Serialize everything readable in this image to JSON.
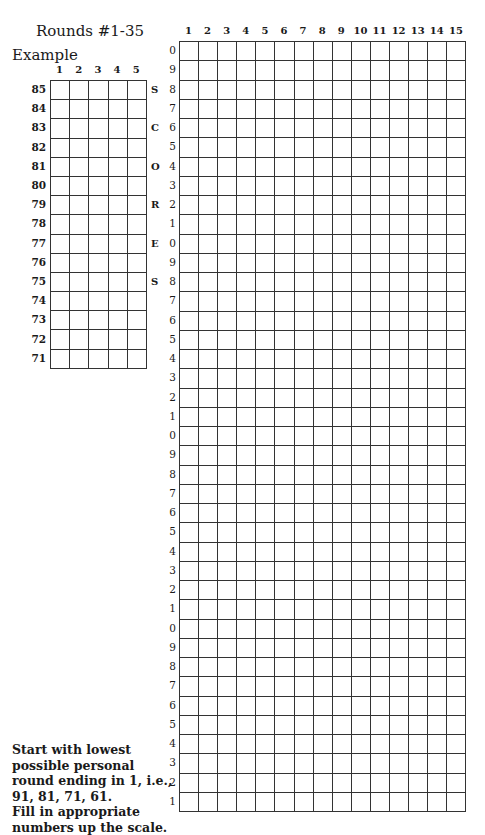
{
  "title": "Rounds #1-35",
  "example": {
    "label": "Example",
    "columns": [
      "1",
      "2",
      "3",
      "4",
      "5"
    ],
    "rows": [
      "85",
      "84",
      "83",
      "82",
      "81",
      "80",
      "79",
      "78",
      "77",
      "76",
      "75",
      "74",
      "73",
      "72",
      "71"
    ],
    "side_letters": [
      {
        "row": 0,
        "letter": "S"
      },
      {
        "row": 2,
        "letter": "C"
      },
      {
        "row": 4,
        "letter": "O"
      },
      {
        "row": 6,
        "letter": "R"
      },
      {
        "row": 8,
        "letter": "E"
      },
      {
        "row": 10,
        "letter": "S"
      }
    ]
  },
  "main_grid": {
    "columns": [
      "1",
      "2",
      "3",
      "4",
      "5",
      "6",
      "7",
      "8",
      "9",
      "10",
      "11",
      "12",
      "13",
      "14",
      "15"
    ],
    "rows": [
      "0",
      "9",
      "8",
      "7",
      "6",
      "5",
      "4",
      "3",
      "2",
      "1",
      "0",
      "9",
      "8",
      "7",
      "6",
      "5",
      "4",
      "3",
      "2",
      "1",
      "0",
      "9",
      "8",
      "7",
      "6",
      "5",
      "4",
      "3",
      "2",
      "1",
      "0",
      "9",
      "8",
      "7",
      "6",
      "5",
      "4",
      "3",
      "2",
      "1"
    ]
  },
  "instructions": [
    "Start with lowest",
    "possible personal",
    "round ending in 1, i.e.,",
    "91, 81, 71, 61.",
    "Fill in appropriate",
    "numbers up the scale."
  ]
}
